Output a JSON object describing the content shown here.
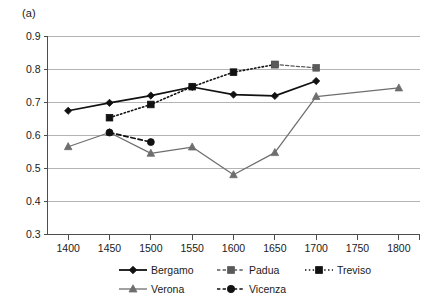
{
  "panel": {
    "label": "(a)"
  },
  "chart_data": {
    "type": "line",
    "title": "",
    "xlabel": "",
    "ylabel": "",
    "xlim": [
      1375,
      1825
    ],
    "ylim": [
      0.3,
      0.9
    ],
    "grid": true,
    "legend_position": "bottom",
    "x_ticks": [
      1400,
      1450,
      1500,
      1550,
      1600,
      1650,
      1700,
      1750,
      1800
    ],
    "y_ticks": [
      "0.3",
      "0.4",
      "0.5",
      "0.6",
      "0.7",
      "0.8",
      "0.9"
    ],
    "series": [
      {
        "name": "Bergamo",
        "marker": "diamond",
        "line_style": "solid",
        "color": "#111111",
        "x": [
          1400,
          1450,
          1500,
          1550,
          1600,
          1650,
          1700
        ],
        "values": [
          0.675,
          0.699,
          0.721,
          0.747,
          0.724,
          0.72,
          0.765
        ]
      },
      {
        "name": "Padua",
        "marker": "square",
        "line_style": "dashed",
        "color": "#5a5a5a",
        "x": [
          1650,
          1700
        ],
        "values": [
          0.815,
          0.805
        ]
      },
      {
        "name": "Treviso",
        "marker": "square",
        "line_style": "dotted",
        "color": "#111111",
        "x": [
          1450,
          1500,
          1550,
          1600,
          1650
        ],
        "values": [
          0.654,
          0.694,
          0.748,
          0.792,
          0.815
        ]
      },
      {
        "name": "Verona",
        "marker": "triangle",
        "line_style": "solid",
        "color": "#6e6e6e",
        "x": [
          1400,
          1450,
          1500,
          1550,
          1600,
          1650,
          1700,
          1800
        ],
        "values": [
          0.566,
          0.609,
          0.546,
          0.565,
          0.481,
          0.548,
          0.718,
          0.744
        ]
      },
      {
        "name": "Vicenza",
        "marker": "circle",
        "line_style": "dashed",
        "color": "#111111",
        "x": [
          1450,
          1500
        ],
        "values": [
          0.609,
          0.58
        ]
      }
    ]
  },
  "legend": {
    "items": [
      {
        "label": "Bergamo",
        "marker": "diamond",
        "line_style": "solid",
        "color": "#111111"
      },
      {
        "label": "Padua",
        "marker": "square",
        "line_style": "dashed",
        "color": "#5a5a5a"
      },
      {
        "label": "Treviso",
        "marker": "square",
        "line_style": "dotted",
        "color": "#111111"
      },
      {
        "label": "Verona",
        "marker": "triangle",
        "line_style": "solid",
        "color": "#6e6e6e"
      },
      {
        "label": "Vicenza",
        "marker": "circle",
        "line_style": "dashed",
        "color": "#111111"
      }
    ]
  }
}
